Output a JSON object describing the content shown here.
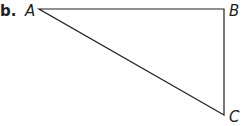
{
  "part_label": "b.",
  "triangle": {
    "vertices": [
      {
        "label": "A",
        "x": 39,
        "y": 9
      },
      {
        "label": "B",
        "x": 224,
        "y": 9
      },
      {
        "label": "C",
        "x": 224,
        "y": 115
      }
    ],
    "stroke_color": "#231f20"
  }
}
